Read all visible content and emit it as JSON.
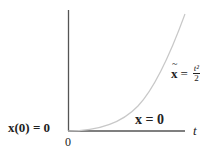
{
  "diagram": {
    "title": "",
    "axes": {
      "x_label": "t",
      "origin_label": "0",
      "color": "#555555"
    },
    "labels": {
      "initial_condition": "x(0) = 0",
      "trivial_solution": "x = 0",
      "nontrivial_solution_lhs": "x",
      "nontrivial_solution_eq": "=",
      "nontrivial_solution_num": "t²",
      "nontrivial_solution_den": "2"
    },
    "curves": [
      {
        "name": "x-tilde",
        "expression": "t^2/2",
        "color": "#c8c8c8"
      },
      {
        "name": "x-zero",
        "expression": "0",
        "color": "#555555"
      }
    ]
  }
}
